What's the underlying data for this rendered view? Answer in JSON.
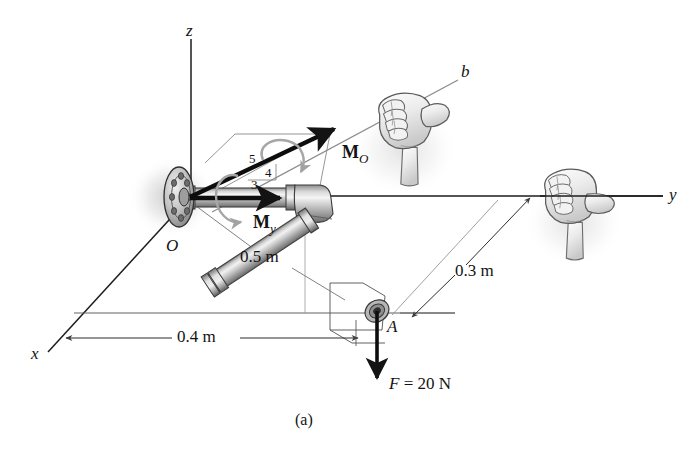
{
  "figure": {
    "caption": "(a)",
    "axes": [
      {
        "name": "z-axis",
        "label": "z"
      },
      {
        "name": "y-axis",
        "label": "y"
      },
      {
        "name": "x-axis",
        "label": "x"
      },
      {
        "name": "b-axis",
        "label": "b"
      }
    ],
    "points": [
      {
        "name": "origin",
        "label": "O"
      },
      {
        "name": "point-a",
        "label": "A"
      }
    ],
    "vectors": [
      {
        "name": "moment-o",
        "label": "M",
        "subscript": "O"
      },
      {
        "name": "moment-y",
        "label": "M",
        "subscript": "y"
      }
    ],
    "slope_triangle": {
      "hypotenuse": "5",
      "horizontal": "4",
      "vertical": "3"
    },
    "dimensions": [
      {
        "name": "dim-05",
        "label": "0.5 m"
      },
      {
        "name": "dim-04",
        "label": "0.4 m"
      },
      {
        "name": "dim-03",
        "label": "0.3 m"
      }
    ],
    "force": {
      "symbol": "F",
      "equals": "=",
      "magnitude": "20",
      "unit": "N",
      "full_label": "F = 20 N"
    },
    "colors": {
      "line": "#1a1a1a",
      "thin_line": "#555555",
      "pipe_light": "#efefef",
      "pipe_mid": "#b9b9b9",
      "pipe_dark": "#7c7c7c",
      "curl_arrow": "#a8a8a8",
      "hand_fill": "#e9e9e9",
      "hand_line": "#6b6b6b",
      "background": "#ffffff"
    }
  }
}
